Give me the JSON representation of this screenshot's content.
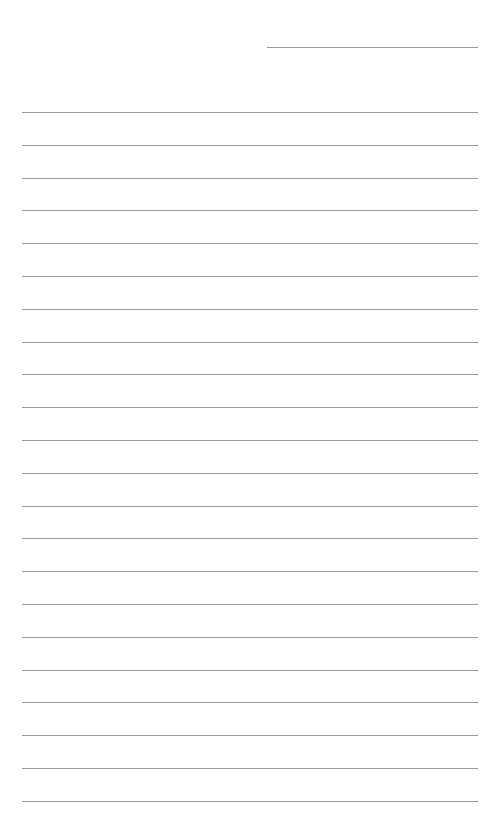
{
  "page": {
    "type": "lined-paper",
    "background_color": "#ffffff",
    "line_color": "#9a9a9a"
  },
  "header_line": {
    "x_start": 267,
    "x_end": 478,
    "y": 47
  },
  "ruled_lines": {
    "count": 22,
    "x_start": 22,
    "x_end": 478,
    "first_y": 112,
    "spacing": 32.8
  }
}
